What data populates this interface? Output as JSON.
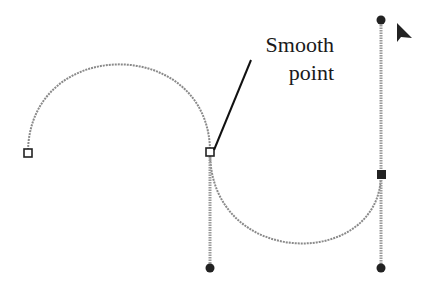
{
  "diagram": {
    "annotation": {
      "line1": "Smooth",
      "line2": "point"
    },
    "colors": {
      "curve": "#8a8a8a",
      "handle_line": "#9a9a9a",
      "anchor_stroke": "#222222",
      "selected_anchor": "#222222",
      "leader": "#111111"
    },
    "anchors": [
      {
        "name": "left-anchor",
        "x": 28,
        "y": 153,
        "selected": false
      },
      {
        "name": "smooth-anchor",
        "x": 210,
        "y": 152,
        "selected": false
      },
      {
        "name": "right-anchor",
        "x": 381,
        "y": 174,
        "selected": true
      }
    ],
    "handles": [
      {
        "name": "smooth-handle-bottom",
        "x": 210,
        "y": 268
      },
      {
        "name": "right-handle-top",
        "x": 381,
        "y": 20
      },
      {
        "name": "right-handle-bottom",
        "x": 381,
        "y": 268
      }
    ],
    "cursor": {
      "type": "arrow",
      "x": 396,
      "y": 25
    }
  }
}
